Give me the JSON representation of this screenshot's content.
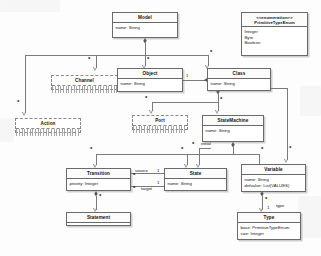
{
  "diagram": {
    "kind": "uml-class-diagram",
    "classes": [
      {
        "id": "model",
        "name": "Model",
        "attributes": [
          "name: String"
        ],
        "stereotype": "",
        "style": "solid"
      },
      {
        "id": "primitive_type_enum",
        "name": "PrimitiveTypeEnum",
        "stereotype": "<<enumeration>>",
        "attributes": [
          "Integer",
          "Byte",
          "Boolean"
        ],
        "style": "solid"
      },
      {
        "id": "channel",
        "name": "Channel",
        "attributes": [],
        "stereotype": "",
        "style": "dashed"
      },
      {
        "id": "object",
        "name": "Object",
        "attributes": [
          "name: String"
        ],
        "stereotype": "",
        "style": "solid"
      },
      {
        "id": "class",
        "name": "Class",
        "attributes": [
          "name: String"
        ],
        "stereotype": "",
        "style": "solid"
      },
      {
        "id": "action",
        "name": "Action",
        "attributes": [],
        "stereotype": "",
        "style": "dashed"
      },
      {
        "id": "port",
        "name": "Port",
        "attributes": [],
        "stereotype": "",
        "style": "dashed"
      },
      {
        "id": "statemachine",
        "name": "StateMachine",
        "attributes": [
          "name: String"
        ],
        "stereotype": "",
        "style": "solid"
      },
      {
        "id": "transition",
        "name": "Transition",
        "attributes": [
          "priority: Integer"
        ],
        "stereotype": "",
        "style": "solid"
      },
      {
        "id": "state",
        "name": "State",
        "attributes": [
          "name: String"
        ],
        "stereotype": "",
        "style": "solid"
      },
      {
        "id": "variable",
        "name": "Variable",
        "attributes": [
          "name: String",
          "defvalue: List(VALUES)"
        ],
        "stereotype": "",
        "style": "solid"
      },
      {
        "id": "statement",
        "name": "Statement",
        "attributes": [],
        "stereotype": "",
        "style": "solid"
      },
      {
        "id": "type",
        "name": "Type",
        "attributes": [
          "base: PrimitiveTypeEnum",
          "size: Integer"
        ],
        "stereotype": "",
        "style": "solid"
      }
    ],
    "multiplicities": {
      "model_object": "*",
      "model_class": "*",
      "model_channel": "*",
      "model_action": "*",
      "object_class": "1",
      "class_port": "*",
      "class_statemachine": "*",
      "statemachine_state": "*",
      "statemachine_variable": "*",
      "statemachine_initial": "*",
      "class_variable": "*",
      "sm_transition": "*",
      "transition_source": "1",
      "transition_target": "1",
      "state_out": "*",
      "state_in": "*",
      "transition_statement": "*",
      "variable_type": "*",
      "type_end": "1"
    },
    "roles": {
      "source": "source",
      "target": "target",
      "initial": "initial",
      "type": "type"
    }
  }
}
